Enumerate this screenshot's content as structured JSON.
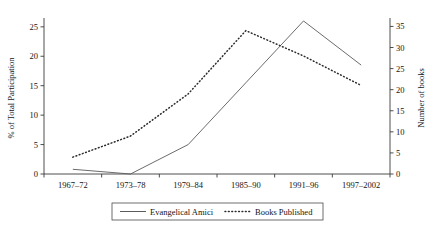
{
  "chart_data": {
    "type": "line",
    "title": "",
    "xlabel": "",
    "categories": [
      "1967–72",
      "1973–78",
      "1979–84",
      "1985–90",
      "1991–96",
      "1997–2002"
    ],
    "grid": false,
    "legend_position": "bottom",
    "axes": {
      "left": {
        "label": "% of Total Participation",
        "ticks": [
          "0",
          "5",
          "10",
          "15",
          "20",
          "25"
        ],
        "tick_values": [
          0,
          5,
          10,
          15,
          20,
          25
        ],
        "range": [
          0,
          26.5
        ]
      },
      "right": {
        "label": "Number of books",
        "ticks": [
          "0",
          "5",
          "10",
          "15",
          "20",
          "25",
          "30",
          "35"
        ],
        "tick_values": [
          0,
          5,
          10,
          15,
          20,
          25,
          30,
          35
        ],
        "range": [
          0,
          37
        ]
      }
    },
    "series": [
      {
        "name": "Evangelical Amici",
        "axis": "left",
        "style": "solid",
        "color": "#5a5a5a",
        "values": [
          0.8,
          0,
          5,
          15.5,
          26,
          18.5
        ]
      },
      {
        "name": "Books Published",
        "axis": "right",
        "style": "dotted",
        "color": "#2b2b2b",
        "values": [
          4,
          9,
          19,
          34,
          28,
          21
        ]
      }
    ]
  },
  "legend": {
    "items": [
      {
        "label": "Evangelical Amici",
        "style": "solid"
      },
      {
        "label": "Books Published",
        "style": "dotted"
      }
    ]
  }
}
